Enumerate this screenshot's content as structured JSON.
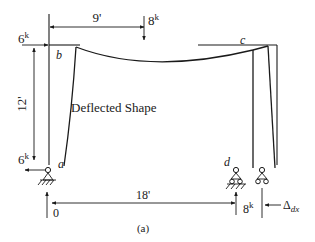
{
  "diagram": {
    "caption": "(a)",
    "deflected_shape_label": "Deflected Shape",
    "joints": {
      "a": "a",
      "b": "b",
      "c": "c",
      "d": "d"
    },
    "dimensions": {
      "top_span": "9'",
      "bottom_span": "18'",
      "column_height": "12'"
    },
    "loads": {
      "top_horizontal": {
        "value": "6",
        "unit": "k"
      },
      "top_vertical": {
        "value": "8",
        "unit": "k"
      },
      "base_a_horizontal": {
        "value": "6",
        "unit": "k"
      },
      "base_a_vertical": {
        "value": "0"
      },
      "base_d_vertical": {
        "value": "8",
        "unit": "k"
      },
      "displacement_label": "Δ",
      "displacement_subscript": "dx"
    },
    "colors": {
      "ink": "#1a1a1a",
      "background": "#ffffff"
    }
  }
}
